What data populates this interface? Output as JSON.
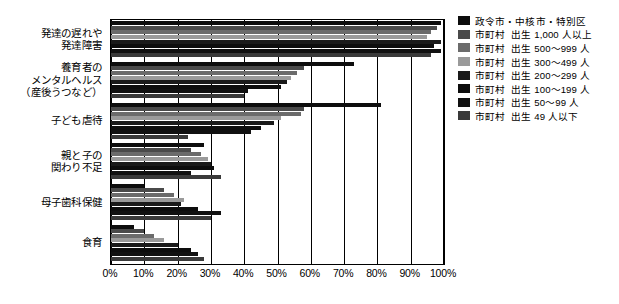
{
  "chart_data": {
    "type": "bar",
    "orientation": "horizontal",
    "title": "",
    "xlabel": "",
    "ylabel": "",
    "xlim": [
      0,
      100
    ],
    "xtick_labels": [
      "0%",
      "10%",
      "20%",
      "30%",
      "40%",
      "50%",
      "60%",
      "70%",
      "80%",
      "90%",
      "100%"
    ],
    "xtick_values": [
      0,
      10,
      20,
      30,
      40,
      50,
      60,
      70,
      80,
      90,
      100
    ],
    "grid": true,
    "legend_position": "right",
    "categories": [
      "発達の遅れや\n発達障害",
      "養育者の\nメンタルヘルス\n（産後うつなど）",
      "子ども虐待",
      "親と子の\n関わり不足",
      "母子歯科保健",
      "食育"
    ],
    "series": [
      {
        "name": "政令市・中核市・特別区",
        "color": "#0d0d0d",
        "values": [
          99,
          73,
          81,
          28,
          10,
          7
        ]
      },
      {
        "name": "市町村　出生 1,000 人以上",
        "color": "#4a4a4a",
        "values": [
          98,
          58,
          58,
          24,
          16,
          10
        ]
      },
      {
        "name": "市町村　出生 500〜999 人",
        "color": "#6b6b6b",
        "values": [
          96,
          56,
          57,
          27,
          19,
          13
        ]
      },
      {
        "name": "市町村　出生 300〜499 人",
        "color": "#9a9a9a",
        "values": [
          95,
          54,
          51,
          29,
          22,
          16
        ]
      },
      {
        "name": "市町村　出生 200〜299 人",
        "color": "#1a1a1a",
        "values": [
          99,
          53,
          49,
          30,
          21,
          20
        ]
      },
      {
        "name": "市町村　出生 100〜199 人",
        "color": "#0d0d0d",
        "values": [
          97,
          51,
          45,
          31,
          26,
          24
        ]
      },
      {
        "name": "市町村　出生 50〜99 人",
        "color": "#111111",
        "values": [
          99,
          41,
          42,
          24,
          33,
          26
        ]
      },
      {
        "name": "市町村　出生 49 人以下",
        "color": "#3a3a3a",
        "values": [
          96,
          40,
          23,
          33,
          30,
          28
        ]
      }
    ]
  },
  "legend": {
    "items": [
      {
        "label_left": "政令市・中核市・特別区",
        "label_right": ""
      },
      {
        "label_left": "市町村",
        "label_right": "出生 1,000 人以上"
      },
      {
        "label_left": "市町村",
        "label_right": "出生 500〜999 人"
      },
      {
        "label_left": "市町村",
        "label_right": "出生 300〜499 人"
      },
      {
        "label_left": "市町村",
        "label_right": "出生 200〜299 人"
      },
      {
        "label_left": "市町村",
        "label_right": "出生 100〜199 人"
      },
      {
        "label_left": "市町村",
        "label_right": "出生 50〜99 人"
      },
      {
        "label_left": "市町村",
        "label_right": "出生 49 人以下"
      }
    ]
  }
}
